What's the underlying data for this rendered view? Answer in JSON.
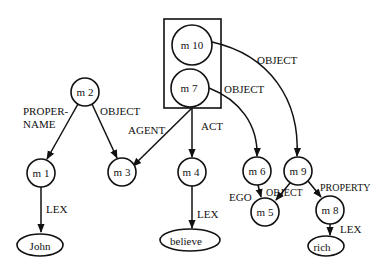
{
  "diagram": {
    "type": "semantic-network",
    "nodes": {
      "m10": "m 10",
      "m7": "m 7",
      "m2": "m 2",
      "m1": "m 1",
      "m3": "m 3",
      "m4": "m 4",
      "m6": "m 6",
      "m9": "m 9",
      "m5": "m 5",
      "m8": "m 8",
      "john": "John",
      "believe": "believe",
      "rich": "rich"
    },
    "arcs": {
      "m10_m9": "OBJECT",
      "m7_m6": "OBJECT",
      "m7_m3": "AGENT",
      "m7_m4": "ACT",
      "m2_m1_line1": "PROPER-",
      "m2_m1_line2": "NAME",
      "m2_m3": "OBJECT",
      "m1_john": "LEX",
      "m4_believe": "LEX",
      "m6_m5": "EGO",
      "m9_m5": "OBJECT",
      "m9_m8": "PROPERTY",
      "m8_rich": "LEX"
    }
  }
}
